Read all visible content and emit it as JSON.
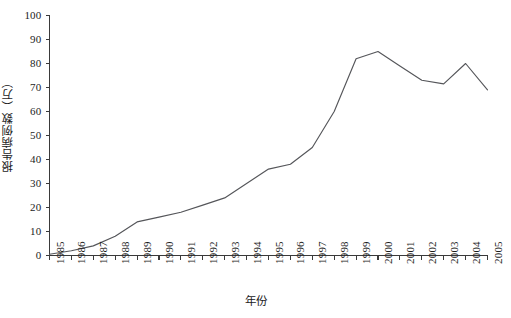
{
  "chart_data": {
    "type": "line",
    "title": "",
    "xlabel": "年份",
    "ylabel": "报告病例数（万）",
    "x": [
      "1985",
      "1986",
      "1987",
      "1988",
      "1989",
      "1990",
      "1991",
      "1992",
      "1993",
      "1994",
      "1995",
      "1996",
      "1997",
      "1998",
      "1999",
      "2000",
      "2001",
      "2002",
      "2003",
      "2004",
      "2005"
    ],
    "categories": [
      "1985",
      "1986",
      "1987",
      "1988",
      "1989",
      "1990",
      "1991",
      "1992",
      "1993",
      "1994",
      "1995",
      "1996",
      "1997",
      "1998",
      "1999",
      "2000",
      "2001",
      "2002",
      "2003",
      "2004",
      "2005"
    ],
    "values": [
      0.5,
      2,
      4,
      8,
      14,
      16,
      18,
      21,
      24,
      30,
      36,
      38,
      45,
      60,
      82,
      85,
      79,
      73,
      71.5,
      80,
      69
    ],
    "series": [
      {
        "name": "报告病例数",
        "values": [
          0.5,
          2,
          4,
          8,
          14,
          16,
          18,
          21,
          24,
          30,
          36,
          38,
          45,
          60,
          82,
          85,
          79,
          73,
          71.5,
          80,
          69
        ]
      }
    ],
    "ylim": [
      0,
      100
    ],
    "ytick_labels": [
      "0",
      "10",
      "20",
      "30",
      "40",
      "50",
      "60",
      "70",
      "80",
      "90",
      "100"
    ],
    "ytick_values": [
      0,
      10,
      20,
      30,
      40,
      50,
      60,
      70,
      80,
      90,
      100
    ],
    "ystep": 10,
    "grid": false,
    "legend": false,
    "legend_position": "none",
    "line_color": "#55565a",
    "axis_color": "#3a3a3a"
  }
}
